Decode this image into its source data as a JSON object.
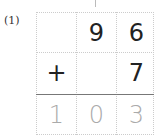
{
  "problem": {
    "label": "(1)",
    "rows": [
      [
        "",
        "9",
        "6"
      ],
      [
        "+",
        "",
        "7"
      ]
    ],
    "answer": [
      "1",
      "0",
      "3"
    ]
  }
}
